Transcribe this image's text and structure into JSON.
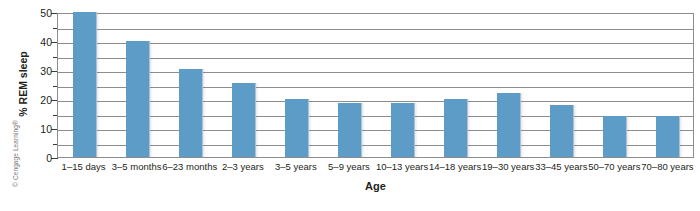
{
  "figure": {
    "credit": "© Cengage Learning®"
  },
  "chart_data": {
    "type": "bar",
    "title": "",
    "xlabel": "Age",
    "ylabel": "% REM sleep",
    "ylim": [
      0,
      50
    ],
    "yticks": [
      0,
      10,
      20,
      30,
      40,
      50
    ],
    "ytick_labels": [
      "0",
      "10",
      "20",
      "30",
      "40",
      "50"
    ],
    "minor_yticks": [
      5,
      15,
      25,
      35,
      45
    ],
    "gridlines": [
      5,
      10,
      15,
      20,
      25,
      30,
      35,
      40,
      45
    ],
    "grid": true,
    "legend": "none",
    "bar_color": "#5d9cc6",
    "categories": [
      "1–15 days",
      "3–5 months",
      "6–23 months",
      "2–3 years",
      "3–5 years",
      "5–9 years",
      "10–13 years",
      "14–18 years",
      "19–30 years",
      "33–45 years",
      "50–70 years",
      "70–80 years"
    ],
    "values": [
      50,
      40,
      30.5,
      25.5,
      20,
      18.5,
      18.5,
      20,
      22,
      18,
      14,
      14
    ]
  }
}
